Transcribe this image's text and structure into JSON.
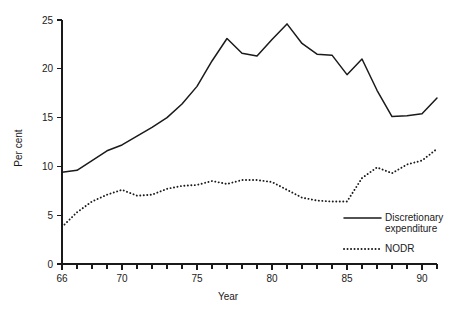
{
  "chart_data": {
    "type": "line",
    "title": "",
    "xlabel": "Year",
    "ylabel": "Per cent",
    "xlim": [
      66,
      91
    ],
    "ylim": [
      0,
      25
    ],
    "grid": false,
    "legend_position": "bottom-right",
    "x_tick_labels": [
      "66",
      "70",
      "75",
      "80",
      "85",
      "90"
    ],
    "x_tick_values": [
      66,
      70,
      75,
      80,
      85,
      90
    ],
    "x_minor_ticks": [
      67,
      68,
      69,
      71,
      72,
      73,
      74,
      76,
      77,
      78,
      79,
      81,
      82,
      83,
      84,
      86,
      87,
      88,
      89,
      91
    ],
    "y_tick_labels": [
      "0",
      "5",
      "10",
      "15",
      "20",
      "25"
    ],
    "y_tick_values": [
      0,
      5,
      10,
      15,
      20,
      25
    ],
    "x": [
      66,
      67,
      68,
      69,
      70,
      71,
      72,
      73,
      74,
      75,
      76,
      77,
      78,
      79,
      80,
      81,
      82,
      83,
      84,
      85,
      86,
      87,
      88,
      89,
      90,
      91
    ],
    "series": [
      {
        "name": "Discretionary expenditure",
        "style": "solid",
        "color": "#1a1a1a",
        "values": [
          9.4,
          9.6,
          10.6,
          11.6,
          12.2,
          13.1,
          14.0,
          15.0,
          16.4,
          18.2,
          20.8,
          23.1,
          21.6,
          21.3,
          23.0,
          24.6,
          22.6,
          21.5,
          21.4,
          19.4,
          21.0,
          17.8,
          15.1,
          15.2,
          15.4,
          17.0
        ]
      },
      {
        "name": "NODR",
        "style": "dotted",
        "color": "#1a1a1a",
        "values": [
          3.8,
          5.3,
          6.4,
          7.1,
          7.6,
          7.0,
          7.1,
          7.7,
          8.0,
          8.1,
          8.5,
          8.2,
          8.6,
          8.6,
          8.4,
          7.6,
          6.8,
          6.5,
          6.4,
          6.4,
          8.8,
          9.9,
          9.3,
          10.2,
          10.6,
          11.8
        ]
      }
    ]
  },
  "legend": {
    "items": [
      {
        "label_line1": "Discretionary",
        "label_line2": "expenditure",
        "style": "solid"
      },
      {
        "label_line1": "NODR",
        "label_line2": "",
        "style": "dotted"
      }
    ]
  }
}
